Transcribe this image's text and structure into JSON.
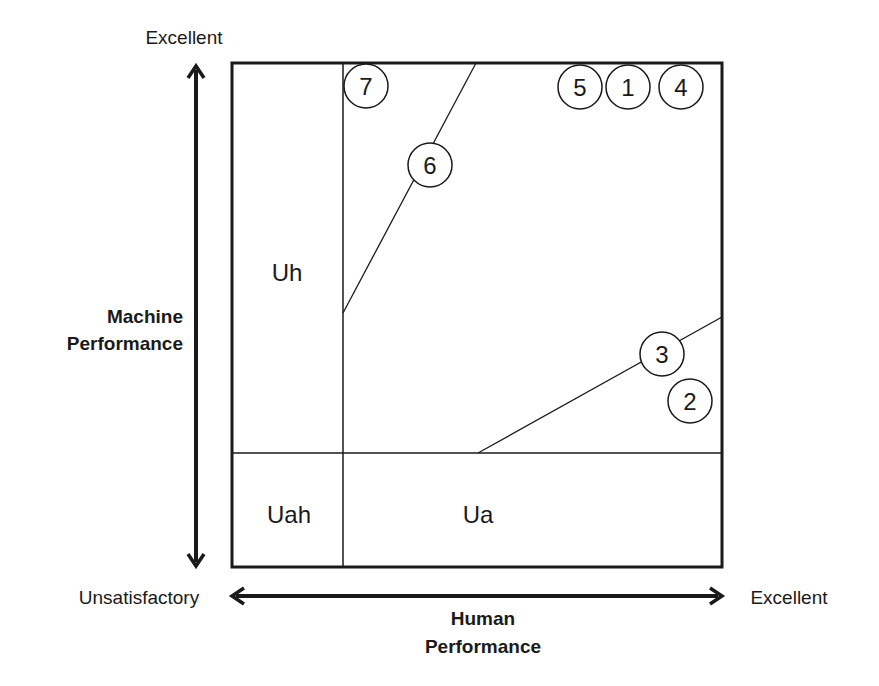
{
  "labels": {
    "y_top": "Excellent",
    "y_axis_line1": "Machine",
    "y_axis_line2": "Performance",
    "x_left": "Unsatisfactory",
    "x_right": "Excellent",
    "x_axis_line1": "Human",
    "x_axis_line2": "Performance"
  },
  "regions": {
    "uh": "Uh",
    "uah": "Uah",
    "ua": "Ua"
  },
  "markers": [
    {
      "id": "7",
      "label": "7",
      "cx": 366,
      "cy": 86
    },
    {
      "id": "6",
      "label": "6",
      "cx": 430,
      "cy": 165
    },
    {
      "id": "5",
      "label": "5",
      "cx": 580,
      "cy": 87
    },
    {
      "id": "1",
      "label": "1",
      "cx": 628,
      "cy": 87
    },
    {
      "id": "4",
      "label": "4",
      "cx": 681,
      "cy": 87
    },
    {
      "id": "3",
      "label": "3",
      "cx": 662,
      "cy": 354
    },
    {
      "id": "2",
      "label": "2",
      "cx": 690,
      "cy": 401
    }
  ],
  "colors": {
    "stroke": "#1a1a1a",
    "background": "#ffffff"
  }
}
